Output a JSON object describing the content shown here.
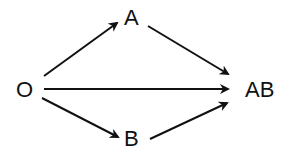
{
  "diagram": {
    "type": "directed-graph",
    "nodes": [
      {
        "id": "O",
        "label": "O"
      },
      {
        "id": "A",
        "label": "A"
      },
      {
        "id": "B",
        "label": "B"
      },
      {
        "id": "AB",
        "label": "AB"
      }
    ],
    "edges": [
      {
        "from": "O",
        "to": "A"
      },
      {
        "from": "O",
        "to": "B"
      },
      {
        "from": "O",
        "to": "AB"
      },
      {
        "from": "A",
        "to": "AB"
      },
      {
        "from": "B",
        "to": "AB"
      }
    ],
    "colors": {
      "stroke": "#111111",
      "background": "#ffffff"
    }
  }
}
